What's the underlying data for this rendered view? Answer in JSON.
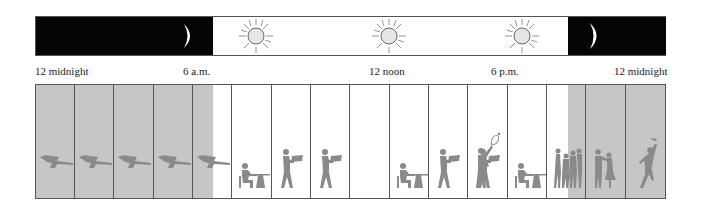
{
  "diagram": {
    "colors": {
      "night": "#050505",
      "night_shade": "#c6c6c6",
      "day": "#ffffff",
      "figure": "#8a8a8a",
      "sun_fill": "#e6e6e6",
      "border": "#555555"
    }
  },
  "timeline": {
    "labels": [
      {
        "text": "12 midnight",
        "x": 35
      },
      {
        "text": "6 a.m.",
        "x": 183
      },
      {
        "text": "12 noon",
        "x": 369
      },
      {
        "text": "6 p.m.",
        "x": 491
      },
      {
        "text": "12 midnight",
        "x": 614
      }
    ],
    "icons": [
      {
        "type": "moon-icon",
        "x": 188
      },
      {
        "type": "sun-icon",
        "x": 255
      },
      {
        "type": "sun-icon",
        "x": 388
      },
      {
        "type": "sun-icon",
        "x": 521
      },
      {
        "type": "moon-icon",
        "x": 593
      }
    ]
  },
  "activities": [
    {
      "hour": 1,
      "activity": "sleeping"
    },
    {
      "hour": 2,
      "activity": "sleeping"
    },
    {
      "hour": 3,
      "activity": "sleeping"
    },
    {
      "hour": 4,
      "activity": "sleeping"
    },
    {
      "hour": 5,
      "activity": "sleeping"
    },
    {
      "hour": 6,
      "activity": "sitting-at-table"
    },
    {
      "hour": 7,
      "activity": "carrying-tray"
    },
    {
      "hour": 8,
      "activity": "carrying-tray"
    },
    {
      "hour": 9,
      "activity": "sitting-at-table"
    },
    {
      "hour": 10,
      "activity": "carrying-tray"
    },
    {
      "hour": 11,
      "activity": "carrying-tray"
    },
    {
      "hour": 12,
      "activity": "playing-tennis"
    },
    {
      "hour": 13,
      "activity": "sitting-at-table"
    },
    {
      "hour": 14,
      "activity": "socializing-group"
    },
    {
      "hour": 15,
      "activity": "dancing-couple"
    },
    {
      "hour": 16,
      "activity": "dancing-solo"
    }
  ]
}
